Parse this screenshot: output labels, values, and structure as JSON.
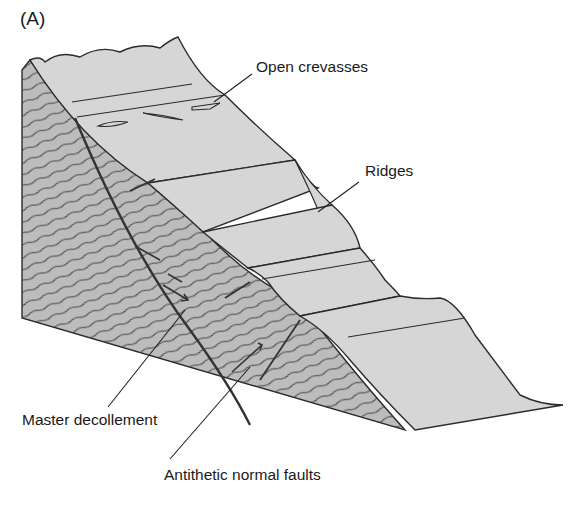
{
  "figure": {
    "panel_label": "(A)",
    "colors": {
      "surface": "#d6d6d6",
      "section": "#b9b9b9",
      "outline": "#2b2b2b",
      "fault": "#3a3a3a",
      "background": "#ffffff"
    }
  },
  "labels": {
    "open_crevasses": "Open crevasses",
    "ridges": "Ridges",
    "master_decollement": "Master decollement",
    "antithetic_faults": "Antithetic normal faults"
  }
}
